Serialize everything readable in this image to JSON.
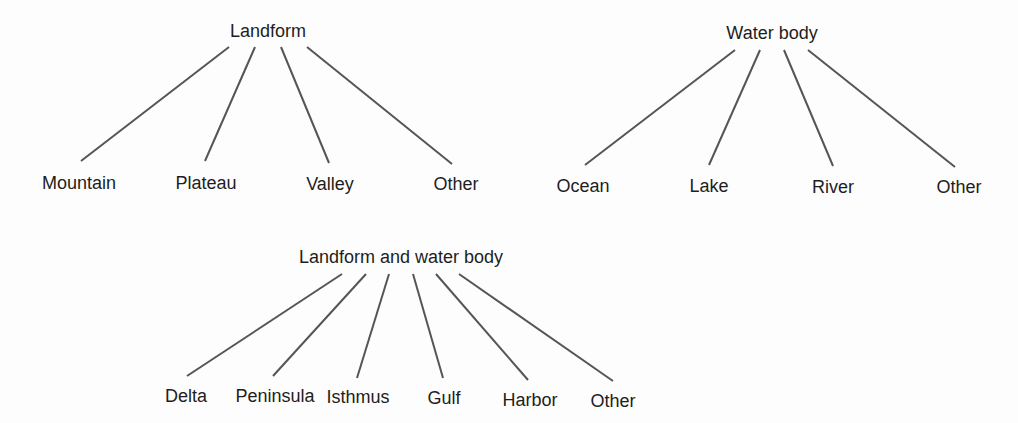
{
  "trees": [
    {
      "root": {
        "label": "Landform",
        "x": 268,
        "y": 22
      },
      "children": [
        {
          "label": "Mountain",
          "x": 79,
          "y": 174,
          "line": [
            229,
            47,
            81,
            161
          ]
        },
        {
          "label": "Plateau",
          "x": 206,
          "y": 174,
          "line": [
            255,
            47,
            205,
            161
          ]
        },
        {
          "label": "Valley",
          "x": 330,
          "y": 175,
          "line": [
            281,
            47,
            329,
            163
          ]
        },
        {
          "label": "Other",
          "x": 456,
          "y": 175,
          "line": [
            307,
            47,
            452,
            164
          ]
        }
      ]
    },
    {
      "root": {
        "label": "Water body",
        "x": 772,
        "y": 24
      },
      "children": [
        {
          "label": "Ocean",
          "x": 583,
          "y": 177,
          "line": [
            735,
            50,
            585,
            165
          ]
        },
        {
          "label": "Lake",
          "x": 709,
          "y": 177,
          "line": [
            760,
            50,
            709,
            165
          ]
        },
        {
          "label": "River",
          "x": 833,
          "y": 178,
          "line": [
            784,
            50,
            833,
            166
          ]
        },
        {
          "label": "Other",
          "x": 959,
          "y": 178,
          "line": [
            808,
            50,
            955,
            167
          ]
        }
      ]
    },
    {
      "root": {
        "label": "Landform and water body",
        "x": 401,
        "y": 248
      },
      "children": [
        {
          "label": "Delta",
          "x": 186,
          "y": 387,
          "line": [
            342,
            274,
            187,
            376
          ]
        },
        {
          "label": "Peninsula",
          "x": 275,
          "y": 387,
          "line": [
            366,
            274,
            273,
            376
          ]
        },
        {
          "label": "Isthmus",
          "x": 358,
          "y": 388,
          "line": [
            389,
            274,
            357,
            378
          ]
        },
        {
          "label": "Gulf",
          "x": 444,
          "y": 389,
          "line": [
            413,
            274,
            443,
            378
          ]
        },
        {
          "label": "Harbor",
          "x": 530,
          "y": 391,
          "line": [
            436,
            274,
            528,
            380
          ]
        },
        {
          "label": "Other",
          "x": 613,
          "y": 392,
          "line": [
            459,
            274,
            613,
            381
          ]
        }
      ]
    }
  ],
  "colors": {
    "line": "#555555",
    "text": "#1e1e1e"
  }
}
